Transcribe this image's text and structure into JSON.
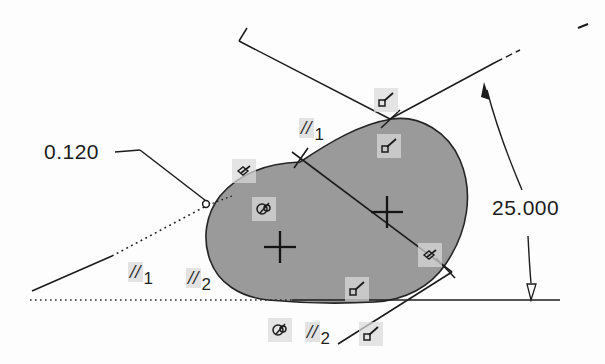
{
  "drawing": {
    "title": "CAD sketch with geometric constraints",
    "background_color": "#fdfdfd",
    "line_color": "#1c1c1c",
    "fill_color": "#9a9a9a",
    "glyph_bg_color": "#dadada"
  },
  "dimensions": [
    {
      "name": "radius-dimension",
      "value": "0.120",
      "kind": "leader",
      "x": 44,
      "y": 140
    },
    {
      "name": "angular-dimension",
      "value": "25.000",
      "kind": "linear-arrow",
      "x": 492,
      "y": 196
    }
  ],
  "constraints": {
    "parallel": [
      {
        "name": "parallel-1-upper",
        "symbol": "//",
        "index": "1",
        "x": 299,
        "y": 118
      },
      {
        "name": "parallel-1-lower",
        "symbol": "//",
        "index": "1",
        "x": 128,
        "y": 262
      },
      {
        "name": "parallel-2-lower",
        "symbol": "//",
        "index": "2",
        "x": 186,
        "y": 268
      },
      {
        "name": "parallel-2-bottom",
        "symbol": "//",
        "index": "2",
        "x": 305,
        "y": 322
      }
    ],
    "glyphs": [
      {
        "name": "tangent-icon-left",
        "type": "tangent",
        "x": 232,
        "y": 159
      },
      {
        "name": "concentric-icon-left",
        "type": "concentric",
        "x": 252,
        "y": 197
      },
      {
        "name": "perpendicular-icon-top",
        "type": "perpendicular",
        "x": 374,
        "y": 88
      },
      {
        "name": "perpendicular-icon-upper",
        "type": "perpendicular",
        "x": 377,
        "y": 134
      },
      {
        "name": "tangent-icon-right",
        "type": "tangent",
        "x": 418,
        "y": 243
      },
      {
        "name": "perpendicular-icon-lower",
        "type": "perpendicular",
        "x": 345,
        "y": 277
      },
      {
        "name": "concentric-icon-bottom",
        "type": "concentric",
        "x": 268,
        "y": 318
      },
      {
        "name": "perpendicular-icon-bottom",
        "type": "perpendicular",
        "x": 359,
        "y": 322
      }
    ]
  },
  "geometry": {
    "profile_name": "closed-blob-profile",
    "center_marks": [
      {
        "name": "center-mark-left",
        "x": 279,
        "y": 247
      },
      {
        "name": "center-mark-right",
        "x": 386,
        "y": 212
      }
    ],
    "endpoint_marker": {
      "name": "endpoint-circle",
      "x": 206,
      "y": 204
    },
    "intersections": [
      {
        "name": "intersection-top",
        "x": 390,
        "y": 119
      },
      {
        "name": "intersection-upper",
        "x": 300,
        "y": 162
      },
      {
        "name": "intersection-right",
        "x": 443,
        "y": 267
      },
      {
        "name": "intersection-bottom",
        "x": 364,
        "y": 300
      }
    ]
  }
}
